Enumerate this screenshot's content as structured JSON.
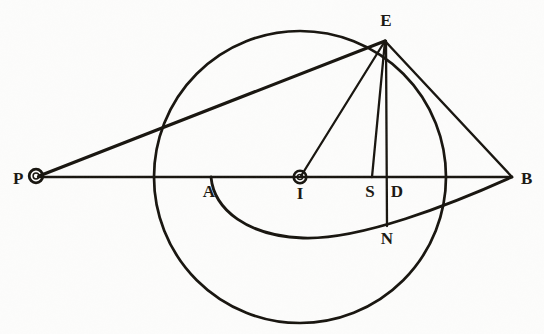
{
  "figure": {
    "type": "euclidean-geometry-figure",
    "background_color": "#fcfcfb",
    "ink_color": "#15120c",
    "canvas": {
      "width": 544,
      "height": 334
    }
  },
  "labels": {
    "P": "P",
    "A": "A",
    "I": "I",
    "S": "S",
    "D": "D",
    "B": "B",
    "E": "E",
    "N": "N"
  },
  "points": {
    "P": {
      "x": 36,
      "y": 177,
      "marker": "small-circle",
      "label_pos": {
        "x": 14,
        "y": 184
      }
    },
    "A": {
      "x": 211,
      "y": 177,
      "marker": "none",
      "label_pos": {
        "x": 203,
        "y": 196
      }
    },
    "I": {
      "x": 300,
      "y": 177,
      "marker": "small-circle",
      "label_pos": {
        "x": 294,
        "y": 198
      }
    },
    "S": {
      "x": 372,
      "y": 177,
      "marker": "none",
      "label_pos": {
        "x": 364,
        "y": 196
      }
    },
    "D": {
      "x": 387,
      "y": 177,
      "marker": "none",
      "label_pos": {
        "x": 391,
        "y": 196
      }
    },
    "B": {
      "x": 512,
      "y": 177,
      "marker": "none",
      "label_pos": {
        "x": 519,
        "y": 184
      }
    },
    "E": {
      "x": 385,
      "y": 40,
      "marker": "none",
      "label_pos": {
        "x": 378,
        "y": 25
      }
    },
    "N": {
      "x": 387,
      "y": 224,
      "marker": "none",
      "label_pos": {
        "x": 379,
        "y": 243
      }
    }
  },
  "circle_main": {
    "name": "principal-circle",
    "center": {
      "x": 300,
      "y": 177
    },
    "radius": 146,
    "stroke_width": 2.6
  },
  "arc_lower": {
    "name": "elliptical-arc-ANB",
    "from": "A",
    "through": "N",
    "to": "B",
    "lowest_point": {
      "x": 303,
      "y": 238
    },
    "stroke_width": 2.6
  },
  "segments": [
    {
      "name": "segment-P-B-axis",
      "from": "P",
      "to": "B",
      "stroke_width": 2.2
    },
    {
      "name": "segment-P-E-tangent",
      "from": "P",
      "to": "E",
      "stroke_width": 3.0
    },
    {
      "name": "segment-E-I",
      "from": "E",
      "to": "I",
      "stroke_width": 2.2
    },
    {
      "name": "segment-E-S",
      "from": "E",
      "to": "S",
      "stroke_width": 2.2
    },
    {
      "name": "segment-E-N-vertical",
      "from": "E",
      "to": "N",
      "stroke_width": 2.2
    },
    {
      "name": "segment-E-B",
      "from": "E",
      "to": "B",
      "stroke_width": 2.2
    }
  ]
}
